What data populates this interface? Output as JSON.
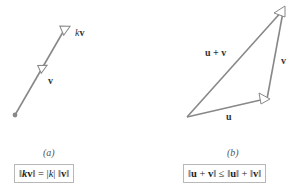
{
  "panel_a": {
    "caption": "(a)",
    "vector_v_label": "v",
    "vector_kv_label_k": "k",
    "vector_kv_label_v": "v",
    "formula": {
      "part1": "‖",
      "k": "k",
      "v": "v",
      "part2": "‖ = |",
      "k2": "k",
      "part3": "| ‖",
      "v2": "v",
      "part4": "‖"
    }
  },
  "panel_b": {
    "caption": "(b)",
    "label_u": "u",
    "label_v": "v",
    "label_sum": "u + v",
    "formula": {
      "part1": "‖",
      "u": "u",
      "plus": " + ",
      "v": "v",
      "part2": "‖ ≤ ‖",
      "u2": "u",
      "part3": "‖ + ‖",
      "v2": "v",
      "part4": "‖"
    }
  },
  "colors": {
    "vector_stroke": "#888888",
    "arrow_fill": "#ffffff",
    "origin_dot": "#888888",
    "box_border": "#b8b8b8"
  }
}
